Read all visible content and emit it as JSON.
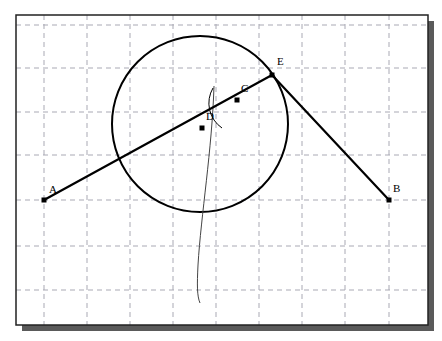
{
  "figure": {
    "canvas": {
      "width": 442,
      "height": 341,
      "background": "#ffffff"
    },
    "frame": {
      "name": "plot-frame",
      "x": 16,
      "y": 15,
      "width": 412,
      "height": 310,
      "border_color": "#222222",
      "border_width": 1.5,
      "fill": "#ffffff",
      "shadow_color": "#5a5a5a",
      "shadow_offset_x": 6,
      "shadow_offset_y": 6
    },
    "grid": {
      "name": "dashed-grid",
      "visible": true,
      "color": "#a9a9b4",
      "stroke_width": 1,
      "dash": "5,4",
      "spacing": 43,
      "vertical_lines": [
        44,
        87,
        130,
        173,
        216,
        259,
        302,
        345,
        389
      ],
      "horizontal_lines": [
        25,
        68,
        112,
        155,
        200,
        246,
        290
      ]
    }
  },
  "chart_data": {
    "type": "scatter",
    "title": "",
    "xlabel": "",
    "ylabel": "",
    "xlim": [
      16,
      428
    ],
    "ylim": [
      325,
      15
    ],
    "grid": true,
    "legend": "none",
    "points": [
      {
        "label": "A",
        "x": 44,
        "y": 200,
        "label_dx": 5,
        "label_dy": -7,
        "marker": "filled-square"
      },
      {
        "label": "B",
        "x": 389,
        "y": 200,
        "label_dx": 4,
        "label_dy": -8,
        "marker": "filled-square"
      },
      {
        "label": "C",
        "x": 237,
        "y": 100,
        "label_dx": 4,
        "label_dy": -8,
        "marker": "filled-square"
      },
      {
        "label": "D",
        "x": 202,
        "y": 128,
        "label_dx": 4,
        "label_dy": -8,
        "marker": "filled-square"
      },
      {
        "label": "E",
        "x": 272,
        "y": 75,
        "label_dx": 5,
        "label_dy": -10,
        "marker": "filled-square"
      }
    ],
    "segments": [
      {
        "name": "segment-AE",
        "from": "A",
        "to": "E",
        "x1": 44,
        "y1": 200,
        "x2": 272,
        "y2": 75,
        "stroke": "#000000",
        "width": 2.2
      },
      {
        "name": "segment-EB",
        "from": "E",
        "to": "B",
        "x1": 272,
        "y1": 75,
        "x2": 389,
        "y2": 200,
        "stroke": "#000000",
        "width": 2.2
      }
    ],
    "circles": [
      {
        "name": "main-circle",
        "cx": 200,
        "cy": 124,
        "r": 88,
        "stroke": "#000000",
        "width": 2.0,
        "fill": "none"
      }
    ],
    "arcs": [
      {
        "name": "angle-arc-at-C",
        "path": "M 213 88 A 30 30 0 0 0 222 128",
        "stroke": "#000000",
        "width": 1.0
      }
    ],
    "curves": [
      {
        "name": "tangent-spline-curve",
        "path": "M 214 86 C 212 150 201 215 198 265 C 197 285 197 296 200 303",
        "stroke": "#444444",
        "width": 1.0
      }
    ]
  },
  "markers": {
    "point_size": 5,
    "point_color": "#000000"
  }
}
